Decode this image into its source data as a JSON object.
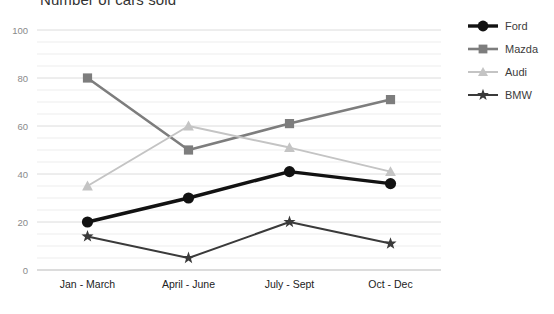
{
  "chart_data": {
    "type": "line",
    "title": "Number of cars sold",
    "xlabel": "",
    "ylabel": "",
    "categories": [
      "Jan - March",
      "April - June",
      "July - Sept",
      "Oct - Dec"
    ],
    "series": [
      {
        "name": "Ford",
        "values": [
          20,
          30,
          41,
          36
        ],
        "color": "#121212",
        "marker": "circle"
      },
      {
        "name": "Mazda",
        "values": [
          80,
          50,
          61,
          71
        ],
        "color": "#7d7d7d",
        "marker": "square"
      },
      {
        "name": "Audi",
        "values": [
          35,
          60,
          51,
          41
        ],
        "color": "#c4c4c4",
        "marker": "triangle"
      },
      {
        "name": "BMW",
        "values": [
          14,
          5,
          20,
          11
        ],
        "color": "#3a3a3a",
        "marker": "star"
      }
    ],
    "ylim": [
      0,
      100
    ],
    "yticks": [
      0,
      20,
      40,
      60,
      80,
      100
    ],
    "ytick_labels": [
      "0",
      "20",
      "40",
      "60",
      "80",
      "100"
    ],
    "minor_gridline_step": 5,
    "grid": true,
    "legend_position": "right"
  },
  "legend": {
    "items": [
      {
        "label": "Ford"
      },
      {
        "label": "Mazda"
      },
      {
        "label": "Audi"
      },
      {
        "label": "BMW"
      }
    ]
  },
  "axis": {
    "y_labels": [
      "100",
      "80",
      "60",
      "40",
      "20",
      "0"
    ],
    "x_labels": [
      "Jan - March",
      "April - June",
      "July - Sept",
      "Oct - Dec"
    ]
  }
}
